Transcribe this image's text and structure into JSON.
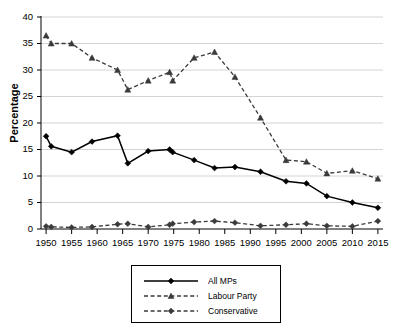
{
  "chart_data": {
    "type": "line",
    "title": "",
    "xlabel": "",
    "ylabel": "Percentage",
    "xlim": [
      1949,
      2016
    ],
    "ylim": [
      0,
      40
    ],
    "grid": true,
    "grid_axis": "y",
    "legend_position": "below-axis-center",
    "x_tick_labels": [
      "1950",
      "1955",
      "1960",
      "1965",
      "1970",
      "1975",
      "1980",
      "1985",
      "1990",
      "1995",
      "2000",
      "2005",
      "2010",
      "2015"
    ],
    "x_tick_values": [
      1950,
      1955,
      1960,
      1965,
      1970,
      1975,
      1980,
      1985,
      1990,
      1995,
      2000,
      2005,
      2010,
      2015
    ],
    "y_tick_labels": [
      "0",
      "5",
      "10",
      "15",
      "20",
      "25",
      "30",
      "35",
      "40"
    ],
    "y_tick_values": [
      0,
      5,
      10,
      15,
      20,
      25,
      30,
      35,
      40
    ],
    "x": [
      1950,
      1951,
      1955,
      1959,
      1964,
      1966,
      1970,
      1974.2,
      1974.8,
      1979,
      1983,
      1987,
      1992,
      1997,
      2001,
      2005,
      2010,
      2015
    ],
    "series": [
      {
        "name": "All MPs",
        "marker": "diamond",
        "dash": "solid",
        "color": "#000000",
        "values": [
          17.5,
          15.6,
          14.5,
          16.5,
          17.6,
          12.4,
          14.7,
          15.0,
          14.5,
          13.0,
          11.5,
          11.7,
          10.8,
          9.0,
          8.6,
          6.2,
          5.0,
          4.0
        ]
      },
      {
        "name": "Labour Party",
        "marker": "triangle",
        "dash": "dashed",
        "color": "#3a3a3a",
        "values": [
          36.5,
          35.0,
          35.0,
          32.3,
          30.0,
          26.3,
          28.0,
          29.6,
          28.0,
          32.3,
          33.4,
          28.7,
          21.0,
          13.0,
          12.7,
          10.5,
          11.0,
          9.5
        ]
      },
      {
        "name": "Conservative",
        "marker": "diamond",
        "dash": "dashed",
        "color": "#3a3a3a",
        "values": [
          0.5,
          0.4,
          0.3,
          0.4,
          0.9,
          1.0,
          0.4,
          0.8,
          1.0,
          1.3,
          1.5,
          1.2,
          0.6,
          0.8,
          1.0,
          0.6,
          0.5,
          1.5
        ]
      }
    ]
  },
  "legend": {
    "items": [
      {
        "label": "All MPs"
      },
      {
        "label": "Labour Party"
      },
      {
        "label": "Conservative"
      }
    ]
  }
}
